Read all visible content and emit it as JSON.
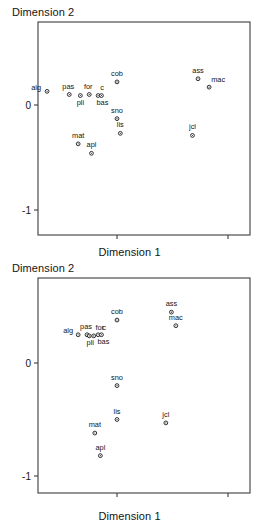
{
  "figures": [
    {
      "id": "top",
      "y_axis_title": "Dimension 2",
      "x_axis_title": "Dimension 1"
    },
    {
      "id": "bottom",
      "y_axis_title": "Dimension 2",
      "x_axis_title": "Dimension 1"
    }
  ],
  "chart_data": [
    {
      "type": "scatter",
      "title": "",
      "xlabel": "Dimension 1",
      "ylabel": "Dimension 2",
      "xlim": [
        -0.71,
        1.2
      ],
      "ylim": [
        -1.22,
        0.36
      ],
      "xticks": [
        0,
        1
      ],
      "xtick_labels": [
        "0",
        "1"
      ],
      "yticks": [
        0,
        -1
      ],
      "ytick_labels": [
        "0",
        "-1"
      ],
      "grid": false,
      "legend": "none",
      "points": [
        {
          "label": "alg",
          "x": -0.63,
          "y": 0.13,
          "label_dx": -11,
          "label_dy": -1
        },
        {
          "label": "pas",
          "x": -0.43,
          "y": 0.1,
          "label_dx": -1,
          "label_dy": -6
        },
        {
          "label": "pli",
          "x": -0.33,
          "y": 0.09,
          "label_dx": 0,
          "label_dy": 9
        },
        {
          "label": "for",
          "x": -0.25,
          "y": 0.1,
          "label_dx": -1,
          "label_dy": -6
        },
        {
          "label": "c",
          "x": -0.17,
          "y": 0.09,
          "label_dx": 4,
          "label_dy": -6
        },
        {
          "label": "bas",
          "x": -0.14,
          "y": 0.09,
          "label_dx": 1,
          "label_dy": 9
        },
        {
          "label": "cob",
          "x": 0.0,
          "y": 0.22,
          "label_dx": 0,
          "label_dy": -6
        },
        {
          "label": "ass",
          "x": 0.73,
          "y": 0.25,
          "label_dx": 0,
          "label_dy": -6
        },
        {
          "label": "mac",
          "x": 0.83,
          "y": 0.17,
          "label_dx": 9,
          "label_dy": -5
        },
        {
          "label": "sno",
          "x": 0.0,
          "y": -0.13,
          "label_dx": 0,
          "label_dy": -6
        },
        {
          "label": "lis",
          "x": 0.03,
          "y": -0.27,
          "label_dx": 0,
          "label_dy": -6
        },
        {
          "label": "jcl",
          "x": 0.68,
          "y": -0.29,
          "label_dx": 0,
          "label_dy": -6
        },
        {
          "label": "mat",
          "x": -0.35,
          "y": -0.37,
          "label_dx": 0,
          "label_dy": -6
        },
        {
          "label": "apl",
          "x": -0.23,
          "y": -0.46,
          "label_dx": 0,
          "label_dy": -6
        }
      ]
    },
    {
      "type": "scatter",
      "title": "",
      "xlabel": "Dimension 1",
      "ylabel": "Dimension 2",
      "xlim": [
        -0.71,
        1.2
      ],
      "ylim": [
        -1.16,
        0.75
      ],
      "xticks": [
        0,
        1
      ],
      "xtick_labels": [
        "0",
        "1"
      ],
      "yticks": [
        0,
        -1
      ],
      "ytick_labels": [
        "0",
        "-1"
      ],
      "grid": false,
      "legend": "none",
      "points": [
        {
          "label": "cob",
          "x": 0.0,
          "y": 0.38,
          "label_dx": 0,
          "label_dy": -6
        },
        {
          "label": "ass",
          "x": 0.49,
          "y": 0.45,
          "label_dx": 0,
          "label_dy": -6
        },
        {
          "label": "mac",
          "x": 0.53,
          "y": 0.33,
          "label_dx": 0,
          "label_dy": -6
        },
        {
          "label": "alg",
          "x": -0.35,
          "y": 0.25,
          "label_dx": -10,
          "label_dy": -2
        },
        {
          "label": "pas",
          "x": -0.27,
          "y": 0.25,
          "label_dx": -1,
          "label_dy": -6
        },
        {
          "label": "pli",
          "x": -0.25,
          "y": 0.24,
          "label_dx": 1,
          "label_dy": 9
        },
        {
          "label": "for",
          "x": -0.21,
          "y": 0.24,
          "label_dx": 6,
          "label_dy": -6
        },
        {
          "label": "c",
          "x": -0.17,
          "y": 0.25,
          "label_dx": 6,
          "label_dy": -5
        },
        {
          "label": "bas",
          "x": -0.14,
          "y": 0.25,
          "label_dx": 2,
          "label_dy": 9
        },
        {
          "label": "sno",
          "x": 0.0,
          "y": -0.2,
          "label_dx": 0,
          "label_dy": -6
        },
        {
          "label": "lis",
          "x": 0.0,
          "y": -0.5,
          "label_dx": 0,
          "label_dy": -6
        },
        {
          "label": "jcl",
          "x": 0.44,
          "y": -0.53,
          "label_dx": 0,
          "label_dy": -6
        },
        {
          "label": "mat",
          "x": -0.2,
          "y": -0.62,
          "label_dx": 0,
          "label_dy": -6
        },
        {
          "label": "apl",
          "x": -0.15,
          "y": -0.82,
          "label_dx": 0,
          "label_dy": -6
        }
      ]
    }
  ]
}
